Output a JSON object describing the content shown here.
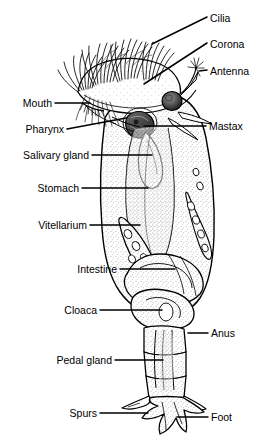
{
  "figure": {
    "style": "black-and-white line drawing with stipple shading",
    "colors": {
      "background": "#ffffff",
      "ink": "#000000",
      "stipple": "#555555",
      "shading_light": "#e8e8e8",
      "shading_dark": "#3a3a3a"
    }
  },
  "labels": {
    "cilia": "Cilia",
    "corona": "Corona",
    "antenna": "Antenna",
    "mouth": "Mouth",
    "pharynx": "Pharynx",
    "mastax": "Mastax",
    "salivary_gland": "Salivary gland",
    "stomach": "Stomach",
    "vitellarium": "Vitellarium",
    "intestine": "Intestine",
    "cloaca": "Cloaca",
    "anus": "Anus",
    "pedal_gland": "Pedal gland",
    "spurs": "Spurs",
    "foot": "Foot"
  }
}
